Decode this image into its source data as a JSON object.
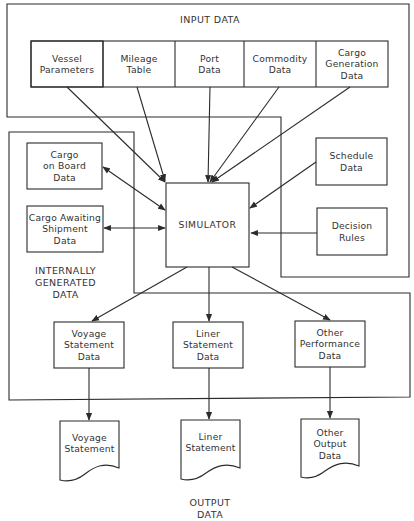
{
  "diagram": {
    "input_section": {
      "title": "INPUT DATA",
      "boxes": [
        {
          "label": "Vessel\nParameters"
        },
        {
          "label": "Mileage\nTable"
        },
        {
          "label": "Port\nData"
        },
        {
          "label": "Commodity\nData"
        },
        {
          "label": "Cargo\nGeneration\nData"
        }
      ],
      "extra_boxes": [
        {
          "label": "Schedule\nData"
        },
        {
          "label": "Decision\nRules"
        }
      ]
    },
    "internal_section": {
      "title": "INTERNALLY\nGENERATED\nDATA",
      "boxes": [
        {
          "label": "Cargo\non Board\nData"
        },
        {
          "label": "Cargo Awaiting\nShipment\nData"
        }
      ],
      "output_data_boxes": [
        {
          "label": "Voyage\nStatement\nData"
        },
        {
          "label": "Liner\nStatement\nData"
        },
        {
          "label": "Other\nPerformance\nData"
        }
      ]
    },
    "center": {
      "label": "SIMULATOR"
    },
    "output_section": {
      "title": "OUTPUT\nDATA",
      "documents": [
        {
          "label": "Voyage\nStatement"
        },
        {
          "label": "Liner\nStatement"
        },
        {
          "label": "Other\nOutput\nData"
        }
      ]
    },
    "colors": {
      "line": "#2b2b2b",
      "background": "#ffffff",
      "text": "#333333"
    }
  }
}
